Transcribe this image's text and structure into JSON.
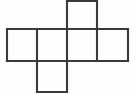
{
  "figure": {
    "shape_kind": "cube-net",
    "square_count": 6,
    "background_color": "#fdfdfd",
    "line_color": "#3a3a3c",
    "line_width": 2.1,
    "face_fill_color": "#fefefe"
  },
  "geometry": {
    "canvas_width": 135,
    "canvas_height": 94,
    "cell_size": 30.3,
    "vertical_gridlines": [
      7,
      37,
      67,
      97,
      128
    ],
    "horizontal_gridlines": [
      1,
      29,
      61,
      92
    ],
    "squares": [
      {
        "name": "top-square",
        "x": 67,
        "y": 1,
        "w": 30,
        "h": 28,
        "row": "top",
        "column": 3
      },
      {
        "name": "row-square-1",
        "x": 7,
        "y": 29,
        "w": 30,
        "h": 32,
        "row": "middle",
        "column": 1
      },
      {
        "name": "row-square-2",
        "x": 37,
        "y": 29,
        "w": 30,
        "h": 32,
        "row": "middle",
        "column": 2
      },
      {
        "name": "row-square-3",
        "x": 67,
        "y": 29,
        "w": 30,
        "h": 32,
        "row": "middle",
        "column": 3
      },
      {
        "name": "row-square-4",
        "x": 97,
        "y": 29,
        "w": 31,
        "h": 32,
        "row": "middle",
        "column": 4
      },
      {
        "name": "bottom-square",
        "x": 37,
        "y": 61,
        "w": 30,
        "h": 31,
        "row": "bottom",
        "column": 2
      }
    ],
    "edges": [
      {
        "name": "top-square-top-edge",
        "x1": 67,
        "y1": 1,
        "x2": 97,
        "y2": 1
      },
      {
        "name": "top-square-left-edge",
        "x1": 67,
        "y1": 1,
        "x2": 67,
        "y2": 29
      },
      {
        "name": "top-square-right-edge",
        "x1": 97,
        "y1": 1,
        "x2": 97,
        "y2": 29
      },
      {
        "name": "middle-row-top-edge",
        "x1": 7,
        "y1": 29,
        "x2": 128,
        "y2": 29
      },
      {
        "name": "middle-row-bottom-edge",
        "x1": 7,
        "y1": 61,
        "x2": 128,
        "y2": 61
      },
      {
        "name": "middle-row-left-edge",
        "x1": 7,
        "y1": 29,
        "x2": 7,
        "y2": 61
      },
      {
        "name": "middle-row-right-edge",
        "x1": 128,
        "y1": 29,
        "x2": 128,
        "y2": 61
      },
      {
        "name": "middle-divider-1",
        "x1": 37,
        "y1": 29,
        "x2": 37,
        "y2": 61
      },
      {
        "name": "middle-divider-2",
        "x1": 67,
        "y1": 29,
        "x2": 67,
        "y2": 61
      },
      {
        "name": "middle-divider-3",
        "x1": 97,
        "y1": 29,
        "x2": 97,
        "y2": 61
      },
      {
        "name": "bottom-square-left-edge",
        "x1": 37,
        "y1": 61,
        "x2": 37,
        "y2": 92
      },
      {
        "name": "bottom-square-right-edge",
        "x1": 67,
        "y1": 61,
        "x2": 67,
        "y2": 92
      },
      {
        "name": "bottom-square-bottom-edge",
        "x1": 37,
        "y1": 92,
        "x2": 67,
        "y2": 92
      }
    ]
  },
  "labels": {
    "visible_text": []
  }
}
